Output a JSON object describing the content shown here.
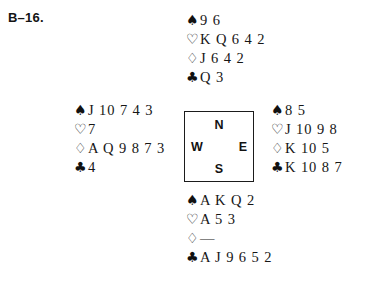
{
  "deal": {
    "label": "B–16."
  },
  "suits": {
    "spade": {
      "glyph": "♠",
      "name": "spade-icon"
    },
    "heart": {
      "glyph": "♡",
      "name": "heart-icon"
    },
    "diamond": {
      "glyph": "♢",
      "name": "diamond-icon"
    },
    "club": {
      "glyph": "♣",
      "name": "club-icon"
    }
  },
  "compass": {
    "north": "N",
    "south": "S",
    "west": "W",
    "east": "E"
  },
  "hands": {
    "north": {
      "position": "North",
      "spades": "9 6",
      "hearts": "K Q 6 4 2",
      "diamonds": "J 6 4 2",
      "clubs": "Q 3"
    },
    "west": {
      "position": "West",
      "spades": "J 10 7 4 3",
      "hearts": "7",
      "diamonds": "A Q 9 8 7 3",
      "clubs": "4"
    },
    "east": {
      "position": "East",
      "spades": "8 5",
      "hearts": "J 10 9 8",
      "diamonds": "K 10 5",
      "clubs": "K 10 8 7"
    },
    "south": {
      "position": "South",
      "spades": "A K Q 2",
      "hearts": "A 5 3",
      "diamonds": "—",
      "clubs": "A J 9 6 5 2"
    }
  }
}
